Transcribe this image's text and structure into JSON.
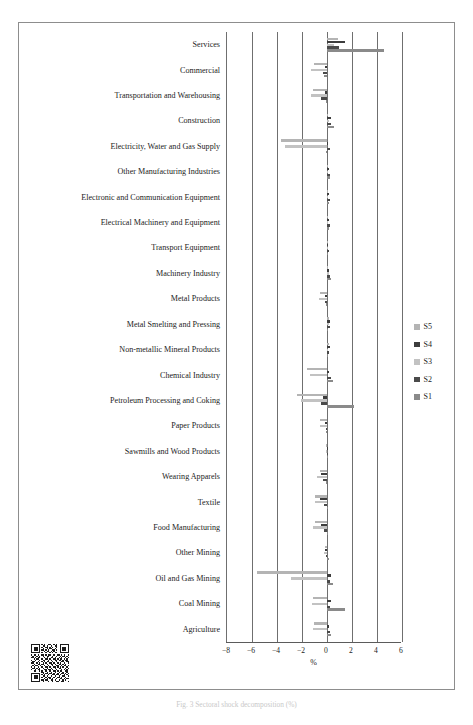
{
  "figure": {
    "caption": "Fig. 3  Sectoral shock decomposition (%)",
    "qr_alt": "qr-code"
  },
  "chart_data": {
    "type": "bar",
    "orientation": "horizontal",
    "title": "",
    "xlabel": "%",
    "ylabel": "",
    "xlim": [
      -8,
      6
    ],
    "xticks": [
      -8,
      -6,
      -4,
      -2,
      0,
      2,
      4,
      6
    ],
    "xticklabels": [
      "−8",
      "−6",
      "−4",
      "−2",
      "0",
      "2",
      "4",
      "6"
    ],
    "grid": true,
    "legend_position": "right",
    "categories": [
      "Services",
      "Commercial",
      "Transportation and Warehousing",
      "Construction",
      "Electricity, Water and Gas Supply",
      "Other Manufacturing Industries",
      "Electronic and Communication Equipment",
      "Electrical Machinery and Equipment",
      "Transport Equipment",
      "Machinery Industry",
      "Metal Products",
      "Metal Smelting and Pressing",
      "Non-metallic Mineral Products",
      "Chemical Industry",
      "Petroleum Processing and Coking",
      "Paper Products",
      "Sawmills and Wood Products",
      "Wearing Apparels",
      "Textile",
      "Food Manufacturing",
      "Other Mining",
      "Oil and Gas Mining",
      "Coal Mining",
      "Agriculture"
    ],
    "series": [
      {
        "name": "S1",
        "color": "#8a8a8a",
        "values": [
          4.55,
          -0.25,
          -0.12,
          0.55,
          -0.1,
          0.22,
          0.12,
          0.18,
          0.1,
          0.3,
          -0.05,
          0.1,
          0.05,
          0.45,
          2.15,
          -0.05,
          0.0,
          -0.1,
          0.05,
          0.05,
          0.12,
          0.45,
          1.4,
          0.3
        ]
      },
      {
        "name": "S2",
        "color": "#4a4a4a",
        "values": [
          0.95,
          -0.3,
          -0.45,
          0.35,
          0.25,
          0.25,
          0.2,
          0.25,
          0.15,
          0.2,
          -0.15,
          0.2,
          0.18,
          0.3,
          -0.45,
          -0.1,
          0.0,
          -0.3,
          -0.25,
          -0.25,
          -0.12,
          0.2,
          0.25,
          0.2
        ]
      },
      {
        "name": "S3",
        "color": "#c2c2c2",
        "values": [
          0.55,
          -1.25,
          -1.3,
          0.12,
          -3.35,
          0.08,
          0.1,
          0.1,
          0.08,
          0.15,
          -0.65,
          0.15,
          0.1,
          -1.35,
          -2.1,
          -0.55,
          -0.05,
          -0.8,
          -1.0,
          -1.1,
          -0.25,
          -2.9,
          -1.2,
          -1.1
        ]
      },
      {
        "name": "S4",
        "color": "#3d3d3d",
        "values": [
          1.45,
          -0.15,
          -0.2,
          0.3,
          0.1,
          0.15,
          0.12,
          0.15,
          0.1,
          0.18,
          -0.2,
          0.25,
          0.2,
          0.15,
          -0.3,
          -0.15,
          0.0,
          -0.45,
          -0.55,
          -0.45,
          -0.18,
          0.35,
          0.3,
          0.18
        ]
      },
      {
        "name": "S5",
        "color": "#b4b4b4",
        "values": [
          0.85,
          -1.05,
          -1.15,
          0.1,
          -3.7,
          0.1,
          0.08,
          0.08,
          0.06,
          0.1,
          -0.6,
          0.18,
          0.12,
          -1.6,
          -2.4,
          -0.6,
          -0.05,
          -0.55,
          -0.95,
          -0.95,
          -0.2,
          -5.6,
          -1.15,
          -1.05
        ]
      }
    ],
    "legend_order": [
      "S5",
      "S4",
      "S3",
      "S2",
      "S1"
    ]
  }
}
